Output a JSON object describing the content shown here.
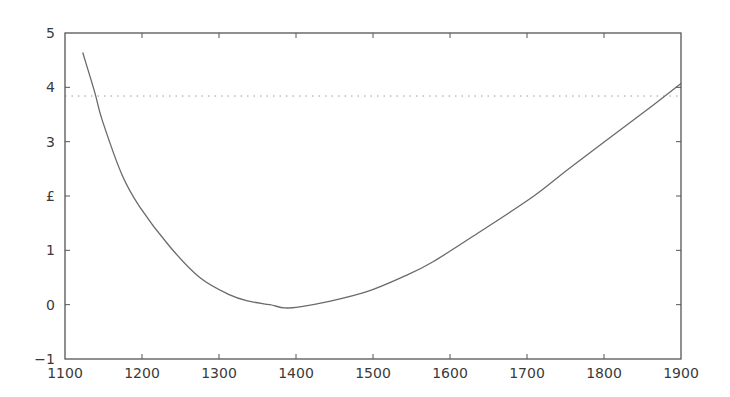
{
  "chart_data": {
    "type": "line",
    "title": "",
    "xlabel": "",
    "ylabel": "",
    "xlim": [
      1100,
      1900
    ],
    "ylim": [
      -1,
      5
    ],
    "grid": false,
    "legend": null,
    "x_ticks": [
      1100,
      1200,
      1300,
      1400,
      1500,
      1600,
      1700,
      1800,
      1900
    ],
    "x_tick_labels": [
      "1100",
      "1200",
      "1300",
      "1400",
      "1500",
      "1600",
      "1700",
      "1800",
      "1900"
    ],
    "y_ticks": [
      -1,
      0,
      1,
      2,
      3,
      4,
      5
    ],
    "y_tick_labels": [
      "−1",
      "0",
      "1",
      "£",
      "3",
      "4",
      "5"
    ],
    "series": [
      {
        "name": "curve",
        "style": "solid",
        "x": [
          1123,
          1139,
          1148,
          1174,
          1197,
          1236,
          1275,
          1314,
          1340,
          1366,
          1385,
          1405,
          1440,
          1492,
          1540,
          1578,
          1643,
          1708,
          1756,
          1830,
          1870,
          1900
        ],
        "y": [
          4.64,
          3.89,
          3.41,
          2.39,
          1.8,
          1.07,
          0.5,
          0.18,
          0.06,
          0.0,
          -0.06,
          -0.04,
          0.05,
          0.24,
          0.52,
          0.79,
          1.38,
          1.99,
          2.52,
          3.31,
          3.74,
          4.07
        ]
      }
    ],
    "reference_lines": [
      {
        "orientation": "horizontal",
        "y": 3.84,
        "style": "dotted"
      }
    ]
  },
  "colors": {
    "frame": "#555555",
    "curve": "#6a6a6a",
    "reference_line": "#9a9a9a",
    "text": "#3a3a3a",
    "background": "#ffffff"
  }
}
